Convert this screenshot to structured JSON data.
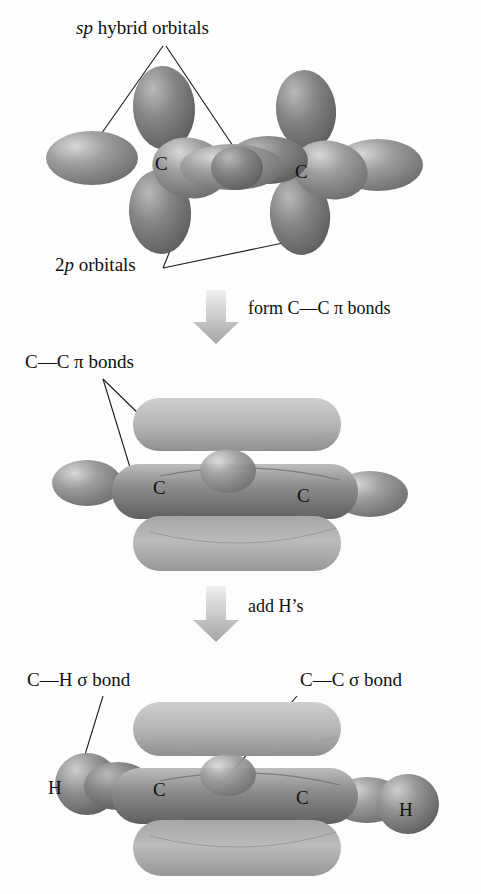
{
  "figure": {
    "background_color": "#fdfdfd",
    "ink_color": "#101010",
    "orbital_dark": "#7d7d7d",
    "orbital_mid": "#9a9a9a",
    "orbital_light": "#c3c3c3",
    "pi_slab_color": "#b4b4b4",
    "arrow_color": "#b9b9b9"
  },
  "panels": [
    {
      "id": "panel-sp-2p",
      "name": "sp hybrid and 2p orbitals",
      "labels": [
        {
          "name": "sp-hybrid-orbitals-label",
          "italic_part": "sp",
          "roman_part": " hybrid orbitals"
        },
        {
          "name": "2p-orbitals-label",
          "lead": "2",
          "italic_part": "p",
          "roman_part": " orbitals"
        }
      ],
      "atoms": [
        {
          "name": "carbon-left",
          "symbol": "C"
        },
        {
          "name": "carbon-right",
          "symbol": "C"
        }
      ]
    },
    {
      "id": "panel-pi-bonds",
      "name": "C-C pi bonds formed",
      "labels": [
        {
          "name": "cc-pi-bonds-label",
          "text": "C—C π bonds"
        }
      ],
      "atoms": [
        {
          "name": "carbon-left",
          "symbol": "C"
        },
        {
          "name": "carbon-right",
          "symbol": "C"
        }
      ]
    },
    {
      "id": "panel-acetylene",
      "name": "acetylene with hydrogens",
      "labels": [
        {
          "name": "ch-sigma-bond-label",
          "text": "C—H σ bond"
        },
        {
          "name": "cc-sigma-bond-label",
          "text": "C—C σ bond"
        }
      ],
      "atoms": [
        {
          "name": "hydrogen-left",
          "symbol": "H"
        },
        {
          "name": "carbon-left",
          "symbol": "C"
        },
        {
          "name": "carbon-right",
          "symbol": "C"
        },
        {
          "name": "hydrogen-right",
          "symbol": "H"
        }
      ]
    }
  ],
  "steps": [
    {
      "name": "step-form-pi-bonds",
      "text": "form C—C π bonds",
      "arrow": "down-arrow"
    },
    {
      "name": "step-add-hydrogens",
      "text": "add H’s",
      "arrow": "down-arrow"
    }
  ],
  "glyphs": {
    "pi": "π",
    "sigma": "σ",
    "em_dash": "—",
    "carbon": "C",
    "hydrogen": "H"
  }
}
